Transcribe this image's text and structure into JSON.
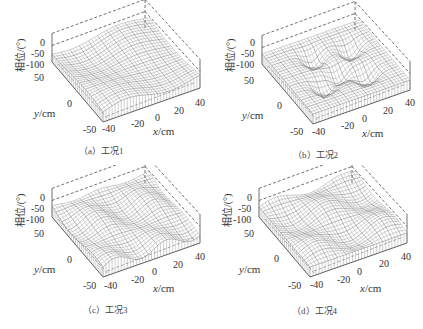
{
  "chart_data": [
    {
      "type": "surface",
      "panel": "a",
      "caption": "（a）工况1",
      "title": "",
      "xlabel": "x/cm",
      "ylabel": "y/cm",
      "zlabel": "相位/(°)",
      "xticks": [
        "-40",
        "-20",
        "0",
        "20",
        "40"
      ],
      "yticks": [
        "-50",
        "0",
        "50"
      ],
      "zticks": [
        "0",
        "-50",
        "-100"
      ],
      "xlim": [
        -40,
        40
      ],
      "ylim": [
        -50,
        50
      ],
      "zlim": [
        -100,
        0
      ],
      "description": "Wireframe phase surface, gentle wavy ridges, phase around -100°"
    },
    {
      "type": "surface",
      "panel": "b",
      "caption": "（b）工况2",
      "title": "",
      "xlabel": "x/cm",
      "ylabel": "y/cm",
      "zlabel": "相位/(°)",
      "xticks": [
        "-40",
        "-20",
        "0",
        "20",
        "40"
      ],
      "yticks": [
        "-50",
        "0",
        "50"
      ],
      "zticks": [
        "0",
        "-50",
        "-100"
      ],
      "xlim": [
        -40,
        40
      ],
      "ylim": [
        -50,
        50
      ],
      "zlim": [
        -100,
        0
      ],
      "description": "Wireframe phase surface with several pronounced dips (bowls)"
    },
    {
      "type": "surface",
      "panel": "c",
      "caption": "（c）工况3",
      "title": "",
      "xlabel": "x/cm",
      "ylabel": "y/cm",
      "zlabel": "相位/(°)",
      "xticks": [
        "-40",
        "-20",
        "0",
        "20",
        "40"
      ],
      "yticks": [
        "-50",
        "0",
        "50"
      ],
      "zticks": [
        "0",
        "-50",
        "-100"
      ],
      "xlim": [
        -40,
        40
      ],
      "ylim": [
        -50,
        50
      ],
      "zlim": [
        -100,
        0
      ],
      "description": "Wireframe phase surface with regular wave ripples"
    },
    {
      "type": "surface",
      "panel": "d",
      "caption": "（d）工况4",
      "title": "",
      "xlabel": "x/cm",
      "ylabel": "y/cm",
      "zlabel": "相位/(°)",
      "xticks": [
        "-40",
        "-20",
        "0",
        "20",
        "40"
      ],
      "yticks": [
        "-50",
        "0",
        "50"
      ],
      "zticks": [
        "0",
        "-50",
        "-100"
      ],
      "xlim": [
        -40,
        40
      ],
      "ylim": [
        -50,
        50
      ],
      "zlim": [
        -100,
        0
      ],
      "description": "Wireframe phase surface with saddle-like waves"
    }
  ],
  "panels": [
    {
      "caption": "（a）工况1"
    },
    {
      "caption": "（b）工况2"
    },
    {
      "caption": "（c）工况3"
    },
    {
      "caption": "（d）工况4"
    }
  ],
  "axes": {
    "zlabel": "相位/(°)",
    "ylabel_var": "y",
    "ylabel_unit": "/cm",
    "xlabel_var": "x",
    "xlabel_unit": "/cm",
    "z0": "0",
    "z50": "-50",
    "z100": "-100",
    "y50": "50",
    "y0": "0",
    "ym50": "-50",
    "xm40": "-40",
    "xm20": "-20",
    "x0": "0",
    "x20": "20",
    "x40": "40"
  }
}
